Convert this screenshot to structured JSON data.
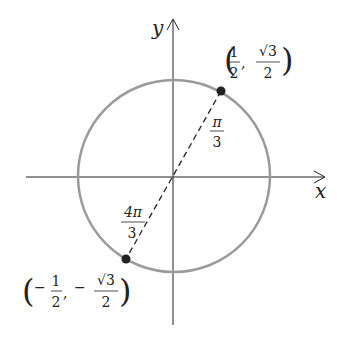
{
  "diagram": {
    "axes": {
      "x_label": "x",
      "y_label": "y"
    },
    "circle": {
      "stroke": "#9a9a9a"
    },
    "points": [
      {
        "name": "point-pi-over-3",
        "x_num": "1",
        "x_den": "2",
        "y_num": "√3",
        "y_den": "2",
        "sign": ""
      },
      {
        "name": "point-4pi-over-3",
        "x_num": "1",
        "x_den": "2",
        "y_num": "√3",
        "y_den": "2",
        "sign": "−"
      }
    ],
    "angles": [
      {
        "num": "π",
        "den": "3"
      },
      {
        "num": "4π",
        "den": "3"
      }
    ]
  }
}
